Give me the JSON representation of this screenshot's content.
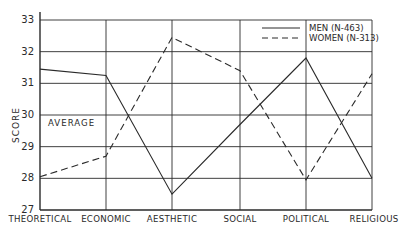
{
  "chart_data": {
    "type": "line",
    "title": "",
    "xlabel": "",
    "ylabel": "SCORE",
    "ylim": [
      27,
      33
    ],
    "yticks": [
      27,
      28,
      29,
      30,
      31,
      32,
      33
    ],
    "grid": true,
    "legend_position": "upper right (inside plot)",
    "categories": [
      "THEORETICAL",
      "ECONOMIC",
      "AESTHETIC",
      "SOCIAL",
      "POLITICAL",
      "RELIGIOUS"
    ],
    "series": [
      {
        "name": "MEN (N-463)",
        "style": "solid",
        "values": [
          31.45,
          31.25,
          27.5,
          29.7,
          31.8,
          28.0
        ]
      },
      {
        "name": "WOMEN (N-313)",
        "style": "dashed",
        "values": [
          28.05,
          28.7,
          32.45,
          31.4,
          27.95,
          31.3
        ]
      }
    ],
    "annotations": [
      {
        "text": "AVERAGE",
        "y": 30
      }
    ]
  },
  "colors": {
    "ink": "#2a2a2a",
    "background": "#ffffff"
  }
}
